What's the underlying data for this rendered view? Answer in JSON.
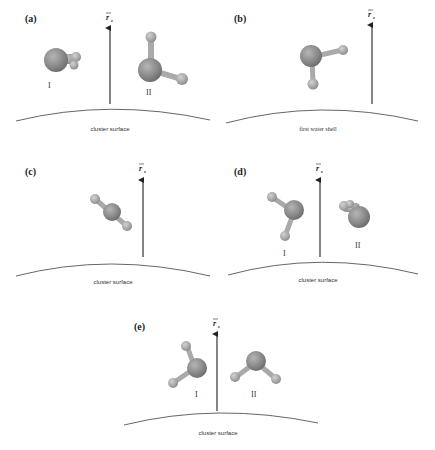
{
  "figure": {
    "panels": [
      {
        "id": "a",
        "label": "(a)",
        "caption": "cluster surface",
        "vector": "r",
        "vector_sub": "s",
        "molecule_labels": [
          "I",
          "II"
        ]
      },
      {
        "id": "b",
        "label": "(b)",
        "caption": "first water shell",
        "vector": "r",
        "vector_sub": "s",
        "molecule_labels": []
      },
      {
        "id": "c",
        "label": "(c)",
        "caption": "cluster surface",
        "vector": "r",
        "vector_sub": "s",
        "molecule_labels": []
      },
      {
        "id": "d",
        "label": "(d)",
        "caption": "cluster surface",
        "vector": "r",
        "vector_sub": "s",
        "molecule_labels": [
          "I",
          "II"
        ]
      },
      {
        "id": "e",
        "label": "(e)",
        "caption": "cluster surface",
        "vector": "r",
        "vector_sub": "s",
        "molecule_labels": [
          "I",
          "II"
        ]
      }
    ]
  }
}
